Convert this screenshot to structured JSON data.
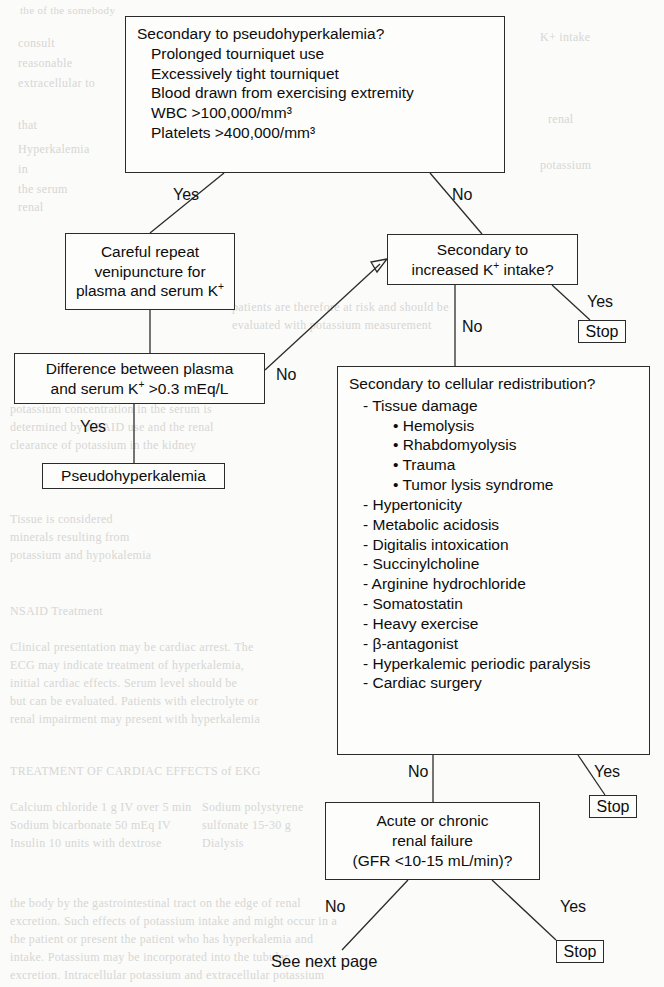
{
  "page": {
    "width": 664,
    "height": 987,
    "background_color": "#fbfbfa",
    "ink_color": "#111111",
    "border_color": "#2b2b2b"
  },
  "nodes": {
    "pseudohyperkalemia_question": {
      "heading": "Secondary to pseudohyperkalemia?",
      "items": [
        "- Prolonged tourniquet use",
        "- Excessively tight tourniquet",
        "- Blood drawn from exercising extremity",
        "- WBC >100,000/mm3",
        "- Platelets >400,000/mm3"
      ],
      "items_plain": [
        "Prolonged tourniquet use",
        "Excessively tight tourniquet",
        "Blood drawn from exercising extremity",
        "WBC >100,000/mm³",
        "Platelets >400,000/mm³"
      ]
    },
    "careful_repeat": {
      "line1": "Careful repeat",
      "line2": "venipuncture for",
      "line3_a": "plasma and serum K",
      "line3_sup": "+"
    },
    "difference_plasma_serum": {
      "line1": "Difference between plasma",
      "line2_a": "and serum K",
      "line2_sup": "+",
      "line2_b": " >0.3 mEq/L"
    },
    "pseudohyperkalemia_result": {
      "label": "Pseudohyperkalemia"
    },
    "increased_intake_question": {
      "line1": "Secondary to",
      "line2_a": "increased K",
      "line2_sup": "+",
      "line2_b": " intake?"
    },
    "cellular_redistribution_question": {
      "heading": "Secondary to cellular redistribution?",
      "items": [
        {
          "level": 1,
          "text": "- Tissue damage"
        },
        {
          "level": 2,
          "text": "• Hemolysis"
        },
        {
          "level": 2,
          "text": "• Rhabdomyolysis"
        },
        {
          "level": 2,
          "text": "• Trauma"
        },
        {
          "level": 2,
          "text": "• Tumor lysis syndrome"
        },
        {
          "level": 1,
          "text": "- Hypertonicity"
        },
        {
          "level": 1,
          "text": "- Metabolic acidosis"
        },
        {
          "level": 1,
          "text": "- Digitalis intoxication"
        },
        {
          "level": 1,
          "text": "- Succinylcholine"
        },
        {
          "level": 1,
          "text": "- Arginine hydrochloride"
        },
        {
          "level": 1,
          "text": "- Somatostatin"
        },
        {
          "level": 1,
          "text": "- Heavy exercise"
        },
        {
          "level": 1,
          "text": "- β-antagonist"
        },
        {
          "level": 1,
          "text": "- Hyperkalemic periodic paralysis"
        },
        {
          "level": 1,
          "text": "- Cardiac surgery"
        }
      ]
    },
    "renal_failure_question": {
      "line1": "Acute or chronic",
      "line2": "renal failure",
      "line3": "(GFR <10-15 mL/min)?"
    },
    "stop_intake": {
      "label": "Stop"
    },
    "stop_redistribution": {
      "label": "Stop"
    },
    "stop_renal": {
      "label": "Stop"
    },
    "see_next_page": {
      "label": "See next page"
    }
  },
  "edge_labels": {
    "top_yes": "Yes",
    "top_no": "No",
    "difference_no": "No",
    "difference_yes": "Yes",
    "intake_yes": "Yes",
    "intake_no": "No",
    "redistribution_no": "No",
    "redistribution_yes": "Yes",
    "renal_no": "No",
    "renal_yes": "Yes"
  },
  "ghost_text": {
    "lines": [
      "of the",
      "consult",
      "reasonable",
      "extracellular",
      "that",
      "Hyperkalemia",
      "in",
      "the",
      "renal",
      "ECG",
      "potassium",
      "emergency",
      "treatment",
      "cardiac",
      "insulin",
      "calcium",
      "dialysis",
      "continue",
      "patients",
      "serum"
    ]
  }
}
